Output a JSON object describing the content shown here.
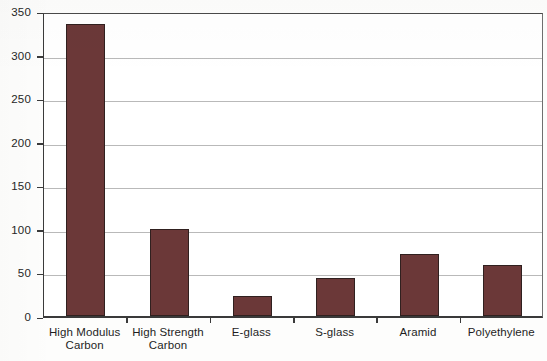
{
  "chart_data": {
    "type": "bar",
    "title": "",
    "xlabel": "",
    "ylabel": "",
    "ylim": [
      0,
      350
    ],
    "yticks": [
      0,
      50,
      100,
      150,
      200,
      250,
      300,
      350
    ],
    "ytick_labels": [
      "0",
      "50",
      "100",
      "150",
      "200",
      "250",
      "300",
      "350"
    ],
    "grid": true,
    "legend": false,
    "bar_color": "#6b3838",
    "bar_edge_color": "#30201f",
    "categories": [
      "High Modulus Carbon",
      "High Strength Carbon",
      "E-glass",
      "S-glass",
      "Aramid",
      "Polyethylene"
    ],
    "category_label_lines": [
      [
        "High Modulus",
        "Carbon"
      ],
      [
        "High Strength",
        "Carbon"
      ],
      [
        "E-glass",
        ""
      ],
      [
        "S-glass",
        ""
      ],
      [
        "Aramid",
        ""
      ],
      [
        "Polyethylene",
        ""
      ]
    ],
    "values": [
      335,
      100,
      23,
      44,
      71,
      59
    ]
  }
}
